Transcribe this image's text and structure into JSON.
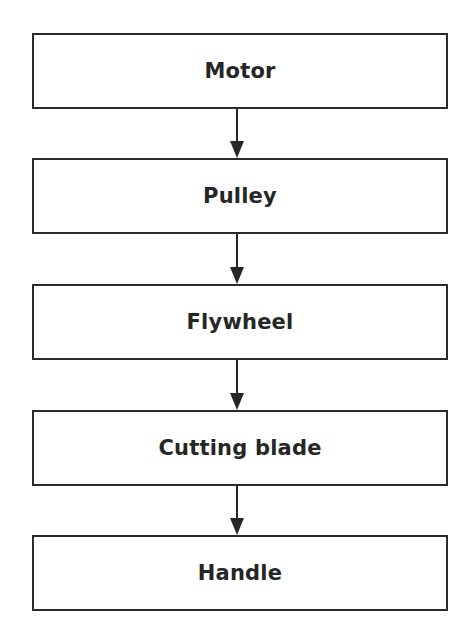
{
  "diagram": {
    "type": "flowchart",
    "direction": "top-to-bottom",
    "nodes": [
      {
        "id": "motor",
        "label": "Motor"
      },
      {
        "id": "pulley",
        "label": "Pulley"
      },
      {
        "id": "flywheel",
        "label": "Flywheel"
      },
      {
        "id": "cutting-blade",
        "label": "Cutting blade"
      },
      {
        "id": "handle",
        "label": "Handle"
      }
    ],
    "edges": [
      {
        "from": "motor",
        "to": "pulley"
      },
      {
        "from": "pulley",
        "to": "flywheel"
      },
      {
        "from": "flywheel",
        "to": "cutting-blade"
      },
      {
        "from": "cutting-blade",
        "to": "handle"
      }
    ],
    "colors": {
      "stroke": "#2a2a2a",
      "text": "#262626",
      "background": "#ffffff"
    }
  }
}
